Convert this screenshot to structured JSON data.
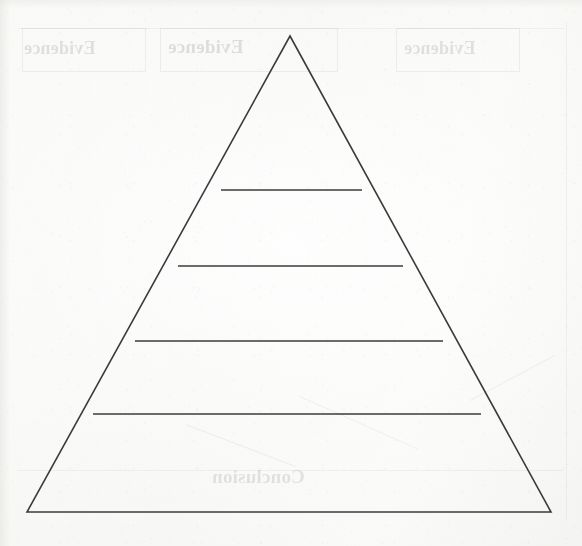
{
  "page": {
    "width": 582,
    "height": 546,
    "background_color": "#fbfbfa",
    "ink_color": "#3b3b3b",
    "showthrough_color": "#000000"
  },
  "diagram": {
    "name": "blank-pyramid-organizer",
    "type": "pyramid",
    "shape": "triangle",
    "tier_count": 5,
    "divider_count": 4,
    "apex": {
      "x": 290,
      "y": 36
    },
    "base_left": {
      "x": 27,
      "y": 512
    },
    "base_right": {
      "x": 551,
      "y": 512
    },
    "outline_stroke_width": 1.6,
    "divider_stroke_width": 1.7,
    "dividers": [
      {
        "label": "divider-1",
        "y": 190,
        "x1": 221,
        "x2": 362
      },
      {
        "label": "divider-2",
        "y": 266,
        "x1": 178,
        "x2": 403
      },
      {
        "label": "divider-3",
        "y": 341,
        "x1": 135,
        "x2": 443
      },
      {
        "label": "divider-4",
        "y": 414,
        "x1": 93,
        "x2": 481
      }
    ],
    "tiers": [
      {
        "index": 1,
        "name": "tier-1-apex",
        "content": ""
      },
      {
        "index": 2,
        "name": "tier-2",
        "content": ""
      },
      {
        "index": 3,
        "name": "tier-3",
        "content": ""
      },
      {
        "index": 4,
        "name": "tier-4",
        "content": ""
      },
      {
        "index": 5,
        "name": "tier-5-base",
        "content": ""
      }
    ]
  },
  "showthrough": {
    "description": "Mirrored ink bleeding through from the reverse side of the scanned sheet",
    "labels": [
      {
        "name": "showthrough-evidence-left",
        "text": "Evidence",
        "x": 24,
        "y": 38,
        "size": 18,
        "opacity": 0.1
      },
      {
        "name": "showthrough-evidence-center",
        "text": "Evidence",
        "x": 168,
        "y": 36,
        "size": 19,
        "opacity": 0.11
      },
      {
        "name": "showthrough-evidence-right",
        "text": "Evidence",
        "x": 404,
        "y": 38,
        "size": 18,
        "opacity": 0.1
      },
      {
        "name": "showthrough-conclusion",
        "text": "Conclusion",
        "x": 212,
        "y": 466,
        "size": 19,
        "opacity": 0.095
      }
    ],
    "boxes": [
      {
        "name": "showthrough-box-left",
        "x": 22,
        "y": 28,
        "w": 124,
        "h": 44
      },
      {
        "name": "showthrough-box-center",
        "x": 160,
        "y": 28,
        "w": 178,
        "h": 44
      },
      {
        "name": "showthrough-box-right",
        "x": 396,
        "y": 28,
        "w": 124,
        "h": 44
      }
    ],
    "rules": [
      {
        "name": "showthrough-rule-top",
        "x": 18,
        "y": 28,
        "w": 546,
        "h": 1
      },
      {
        "name": "showthrough-rule-bottom",
        "x": 18,
        "y": 470,
        "w": 546,
        "h": 1
      },
      {
        "name": "showthrough-rule-right",
        "x": 566,
        "y": 22,
        "w": 1,
        "h": 498
      }
    ],
    "diagonals": [
      {
        "name": "showthrough-diagonal-left",
        "x": 300,
        "y": 396,
        "len": 130,
        "angle": 24
      },
      {
        "name": "showthrough-diagonal-right",
        "x": 470,
        "y": 400,
        "len": 96,
        "angle": -28
      },
      {
        "name": "showthrough-diagonal-low",
        "x": 186,
        "y": 424,
        "len": 118,
        "angle": 21
      }
    ]
  }
}
